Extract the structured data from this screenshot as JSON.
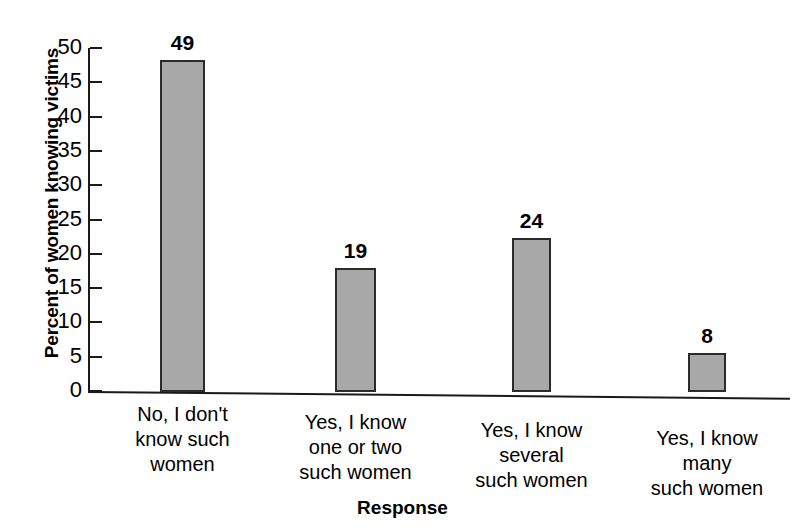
{
  "chart_data": {
    "type": "bar",
    "title": "",
    "xlabel": "Response",
    "ylabel": "Percent of women knowing victims",
    "categories": [
      "No, I don't\nknow such\nwomen",
      "Yes, I know\none or two\nsuch women",
      "Yes, I know\nseveral\nsuch women",
      "Yes, I know\nmany\nsuch women"
    ],
    "values": [
      49,
      19,
      24,
      8
    ],
    "value_labels": [
      "49",
      "19",
      "24",
      "8"
    ],
    "ylim": [
      0,
      50
    ],
    "yticks": [
      0,
      5,
      10,
      15,
      20,
      25,
      30,
      35,
      40,
      45,
      50
    ],
    "ytick_labels": [
      "0",
      "5",
      "10",
      "15",
      "20",
      "25",
      "30",
      "35",
      "40",
      "45",
      "50"
    ],
    "grid": false,
    "legend": false,
    "bar_color": "#a8a8a8",
    "bar_edge_color": "#2b2b2b",
    "axis_color": "#1a1a1a",
    "background": "#ffffff"
  }
}
